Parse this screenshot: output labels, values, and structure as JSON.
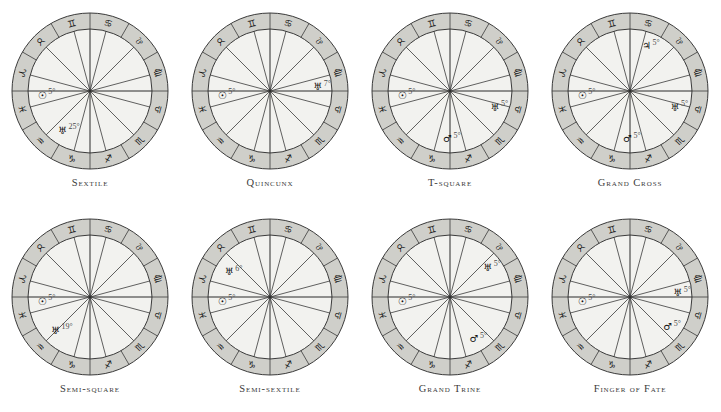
{
  "figure": {
    "layout": {
      "columns": 4,
      "rows": 2
    },
    "colors": {
      "outer_ring": "#cfcfca",
      "inner_disc": "#f2f2ef",
      "stroke": "#3a3a3a",
      "glyph": "#101010",
      "caption": "#3a3a3a"
    },
    "zodiac_ring": [
      {
        "name": "Pisces",
        "glyph": "♓",
        "sector_index": 0
      },
      {
        "name": "Aries",
        "glyph": "♈",
        "sector_index": 1
      },
      {
        "name": "Taurus",
        "glyph": "♉",
        "sector_index": 2
      },
      {
        "name": "Gemini",
        "glyph": "♊",
        "sector_index": 3
      },
      {
        "name": "Cancer",
        "glyph": "♋",
        "sector_index": 4
      },
      {
        "name": "Leo",
        "glyph": "♌",
        "sector_index": 5
      },
      {
        "name": "Virgo",
        "glyph": "♍",
        "sector_index": 6
      },
      {
        "name": "Libra",
        "glyph": "♎",
        "sector_index": 7
      },
      {
        "name": "Scorpio",
        "glyph": "♏",
        "sector_index": 8
      },
      {
        "name": "Sagittarius",
        "glyph": "♐",
        "sector_index": 9
      },
      {
        "name": "Capricorn",
        "glyph": "♑",
        "sector_index": 10
      },
      {
        "name": "Aquarius",
        "glyph": "♒",
        "sector_index": 11
      }
    ],
    "planet_glyphs": {
      "sun": "☉",
      "uranus": "♅",
      "mars": "♂",
      "jupiter": "♃"
    }
  },
  "charts": [
    {
      "id": "sextile",
      "caption": "Sextile",
      "bodies": [
        {
          "planet": "sun",
          "glyph": "☉",
          "degree_label": "5°",
          "sign": "Aquarius",
          "angle": 185
        },
        {
          "planet": "uranus",
          "glyph": "♅",
          "degree_label": "25°",
          "sign": "Aries",
          "angle": 235
        }
      ]
    },
    {
      "id": "quincunx",
      "caption": "Quincunx",
      "bodies": [
        {
          "planet": "sun",
          "glyph": "☉",
          "degree_label": "5°",
          "sign": "Aquarius",
          "angle": 185
        },
        {
          "planet": "uranus",
          "glyph": "♅",
          "degree_label": "7°",
          "sign": "Virgo",
          "angle": 5
        }
      ]
    },
    {
      "id": "t-square",
      "caption": "T-square",
      "bodies": [
        {
          "planet": "sun",
          "glyph": "☉",
          "degree_label": "5°",
          "sign": "Aquarius",
          "angle": 185
        },
        {
          "planet": "uranus",
          "glyph": "♅",
          "degree_label": "5°",
          "sign": "Leo",
          "angle": 340
        },
        {
          "planet": "mars",
          "glyph": "♂",
          "degree_label": "5°",
          "sign": "Taurus",
          "angle": 267
        }
      ]
    },
    {
      "id": "grand-cross",
      "caption": "Grand Cross",
      "bodies": [
        {
          "planet": "sun",
          "glyph": "☉",
          "degree_label": "5°",
          "sign": "Aquarius",
          "angle": 185
        },
        {
          "planet": "uranus",
          "glyph": "♅",
          "degree_label": "5°",
          "sign": "Leo",
          "angle": 340
        },
        {
          "planet": "mars",
          "glyph": "♂",
          "degree_label": "5°",
          "sign": "Taurus",
          "angle": 267
        },
        {
          "planet": "jupiter",
          "glyph": "♃",
          "degree_label": "5°",
          "sign": "Scorpio",
          "angle": 70
        }
      ]
    },
    {
      "id": "semi-square",
      "caption": "Semi-square",
      "bodies": [
        {
          "planet": "sun",
          "glyph": "☉",
          "degree_label": "5°",
          "sign": "Aquarius",
          "angle": 185
        },
        {
          "planet": "uranus",
          "glyph": "♅",
          "degree_label": "19°",
          "sign": "Pisces",
          "angle": 224
        }
      ]
    },
    {
      "id": "semi-sextile",
      "caption": "Semi-sextile",
      "bodies": [
        {
          "planet": "sun",
          "glyph": "☉",
          "degree_label": "5°",
          "sign": "Aquarius",
          "angle": 185
        },
        {
          "planet": "uranus",
          "glyph": "♅",
          "degree_label": "6°",
          "sign": "Capricorn",
          "angle": 148
        }
      ]
    },
    {
      "id": "grand-trine",
      "caption": "Grand Trine",
      "bodies": [
        {
          "planet": "sun",
          "glyph": "☉",
          "degree_label": "5°",
          "sign": "Aquarius",
          "angle": 185
        },
        {
          "planet": "uranus",
          "glyph": "♅",
          "degree_label": "5°",
          "sign": "Libra",
          "angle": 38
        },
        {
          "planet": "mars",
          "glyph": "♂",
          "degree_label": "5°",
          "sign": "Gemini",
          "angle": 300
        }
      ]
    },
    {
      "id": "finger-of-fate",
      "caption": "Finger of Fate",
      "bodies": [
        {
          "planet": "sun",
          "glyph": "☉",
          "degree_label": "5°",
          "sign": "Aquarius",
          "angle": 185
        },
        {
          "planet": "uranus",
          "glyph": "♅",
          "degree_label": "5°",
          "sign": "Virgo",
          "angle": 5
        },
        {
          "planet": "mars",
          "glyph": "♂",
          "degree_label": "5°",
          "sign": "Cancer",
          "angle": 322
        }
      ]
    }
  ]
}
